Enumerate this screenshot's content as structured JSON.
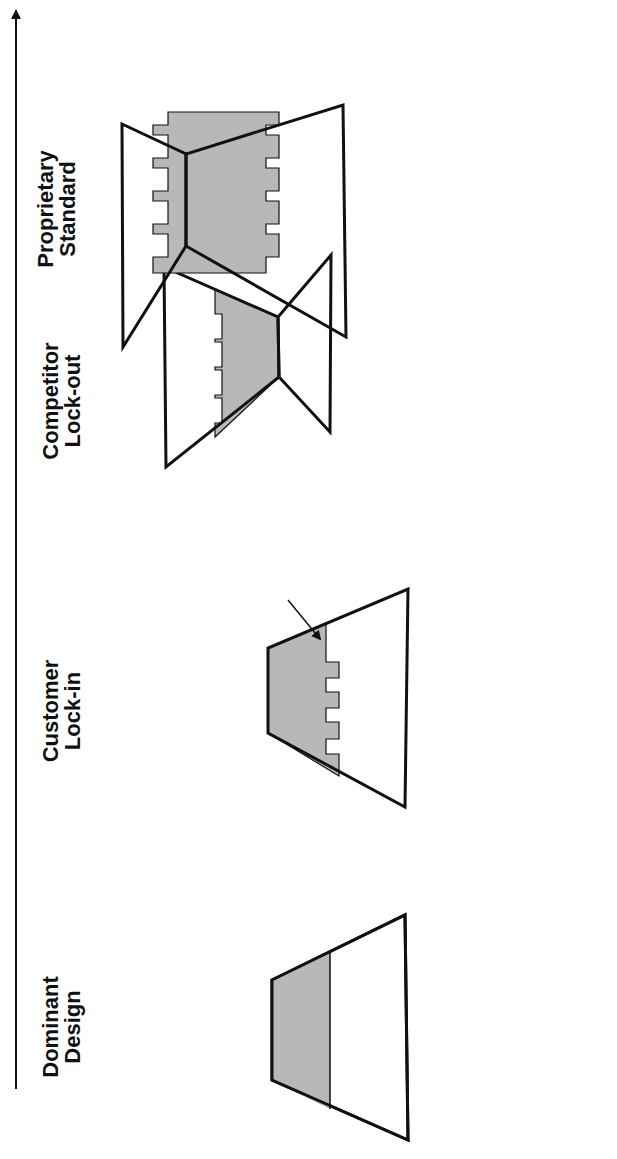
{
  "axis": {
    "direction": "increasing-to-right",
    "arrow": "arrowhead at end"
  },
  "stages": [
    {
      "title_line1": "Dominant",
      "title_line2": "Design",
      "shape_labels": {
        "product": "Product",
        "other": "Customers"
      },
      "bullets": [
        {
          "text": "First mover advantage",
          "sub": [
            "– Features",
            "– Service",
            "– Price"
          ]
        }
      ]
    },
    {
      "title_line1": "Customer",
      "title_line2": "Lock-in",
      "shape_labels": {
        "product": "Product",
        "other": "Customers",
        "callout": "Lock-in"
      },
      "bullets": [
        {
          "text": "Customer learning"
        },
        {
          "text": "Customized product"
        },
        {
          "text": "Collateral assets"
        },
        {
          "text": "Brands"
        },
        {
          "text": "Pricing structure"
        }
      ]
    },
    {
      "title_line1": "Competitor",
      "title_line2": "Lock-out",
      "shape_labels": {
        "product": "Product",
        "left_line1": "Distributors/",
        "left_line2": "Suppliers",
        "right": "Customers"
      },
      "bullets": [
        {
          "text": "Distribution ‘shelf space’"
        },
        {
          "text": "Brands"
        },
        {
          "text": "Relentless innovations"
        },
        {
          "text": "Patents"
        }
      ]
    },
    {
      "title_line1": "Proprietary",
      "title_line2": "Standard",
      "shape_labels": {
        "product": "Product",
        "left": "Complementors",
        "right": "Customers",
        "feedback_line1": "Positive",
        "feedback_line2": "Feedback"
      },
      "bullets": [
        {
          "lines": [
            "Develop network of third",
            "party complementors to",
            "enhance product’s appeal"
          ]
        },
        {
          "lines": [
            "Leverage position as",
            "market share leader in",
            "attracting complementors"
          ]
        },
        {
          "lines": [
            "Customers seek product",
            "with most complementors"
          ]
        }
      ]
    }
  ],
  "colors": {
    "product_fill": "#b8b8b8",
    "stroke": "#111111",
    "background": "#ffffff"
  }
}
